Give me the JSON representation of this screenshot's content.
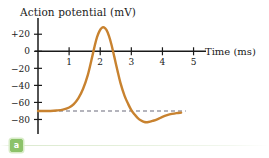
{
  "figure": {
    "part_label": "a",
    "colors": {
      "curve": "#c8822f",
      "axis": "#1a1a1a",
      "resting_dash": "#6b6b7a",
      "badge_green": "#8cc26a",
      "background": "#ffffff"
    }
  },
  "chart_data": {
    "type": "line",
    "title": "Action potential (mV)",
    "xlabel": "Time (ms)",
    "ylabel": "Action potential (mV)",
    "xlim": [
      0,
      5.4
    ],
    "ylim": [
      -90,
      32
    ],
    "xticks": [
      1,
      2,
      3,
      4,
      5
    ],
    "xtick_labels": [
      "1",
      "2",
      "3",
      "4",
      "5"
    ],
    "yticks": [
      20,
      0,
      -20,
      -40,
      -60,
      -80
    ],
    "ytick_labels": [
      "+20",
      "0",
      "−20",
      "−40",
      "−60",
      "−80"
    ],
    "grid": false,
    "legend": "none",
    "annotations": [
      {
        "name": "resting-potential-line",
        "type": "hline",
        "y": -70,
        "style": "dashed",
        "label": ""
      }
    ],
    "series": [
      {
        "name": "Action potential",
        "color": "#c8822f",
        "x": [
          0.0,
          0.2,
          0.4,
          0.6,
          0.8,
          1.0,
          1.15,
          1.3,
          1.45,
          1.6,
          1.72,
          1.82,
          1.9,
          1.98,
          2.05,
          2.12,
          2.2,
          2.28,
          2.36,
          2.45,
          2.55,
          2.65,
          2.78,
          2.9,
          3.0,
          3.1,
          3.2,
          3.3,
          3.42,
          3.55,
          3.7,
          3.85,
          4.0,
          4.15,
          4.3,
          4.45,
          4.6
        ],
        "y": [
          -70,
          -70,
          -70,
          -69.5,
          -68.5,
          -66,
          -62,
          -55,
          -44,
          -28,
          -10,
          6,
          17,
          24,
          27.5,
          28,
          25,
          18,
          8,
          -6,
          -22,
          -37,
          -52,
          -62,
          -69,
          -74,
          -78,
          -81,
          -83,
          -83,
          -81.5,
          -79.5,
          -77,
          -75,
          -73.5,
          -72.5,
          -72
        ]
      }
    ]
  }
}
